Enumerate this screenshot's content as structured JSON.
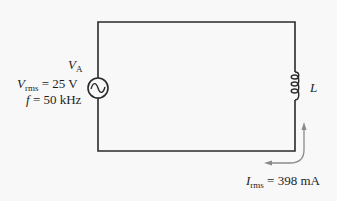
{
  "diagram": {
    "type": "circuit",
    "source": {
      "name": "V",
      "subscript": "A",
      "vrms_symbol": "V",
      "vrms_subscript": "rms",
      "vrms_value": "= 25  V",
      "freq_symbol": "f",
      "freq_value": "= 50  kHz"
    },
    "inductor": {
      "label": "L"
    },
    "current": {
      "symbol": "I",
      "subscript": "rms",
      "value": "= 398  mA"
    }
  },
  "colors": {
    "wire": "#2a2a2a",
    "arrow": "#8a8a8a",
    "background": "#f8f8f8"
  }
}
